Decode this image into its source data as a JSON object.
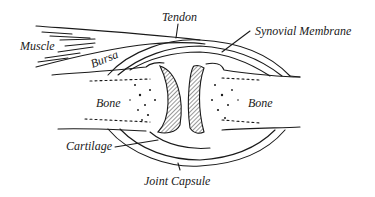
{
  "diagram": {
    "labels": {
      "muscle": "Muscle",
      "tendon": "Tendon",
      "bursa": "Bursa",
      "synovial_membrane": "Synovial Membrane",
      "bone_left": "Bone",
      "bone_right": "Bone",
      "cartilage": "Cartilage",
      "joint_capsule": "Joint Capsule"
    },
    "colors": {
      "ink": "#1a1a1a",
      "background": "#ffffff"
    }
  }
}
